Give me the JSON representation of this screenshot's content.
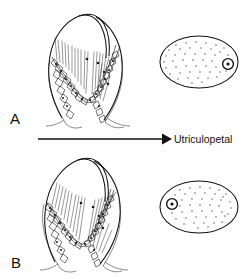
{
  "figure": {
    "background_color": "#ffffff",
    "ink_color": "#1a1a1a",
    "width": 249,
    "height": 279
  },
  "panels": [
    {
      "id": "A",
      "letter": "A",
      "letter_x": 10,
      "letter_y": 124,
      "crista_label": "crista-ampullaris-resting",
      "cross_section": {
        "label": "ampulla-cross-section-a",
        "cx": 199,
        "cy": 62,
        "rx": 39,
        "ry": 26,
        "marker": {
          "label": "cupula-marker",
          "cx": 228,
          "cy": 64,
          "r_outer": 5.4,
          "r_inner": 1.6,
          "position": "right"
        }
      }
    },
    {
      "id": "B",
      "letter": "B",
      "letter_x": 11,
      "letter_y": 268,
      "crista_label": "crista-ampullaris-deflected",
      "cross_section": {
        "label": "ampulla-cross-section-b",
        "cx": 199,
        "cy": 207,
        "rx": 39,
        "ry": 26,
        "marker": {
          "label": "cupula-marker",
          "cx": 172,
          "cy": 204,
          "r_outer": 5.4,
          "r_inner": 1.6,
          "position": "left"
        }
      }
    }
  ],
  "arrow": {
    "label": "direction-arrow",
    "x1": 38,
    "y1": 139,
    "x2": 170,
    "y2": 139,
    "caption": "Utriculopetal",
    "caption_x": 174,
    "caption_y": 143
  },
  "accessibility": {
    "description": "Line drawing of a crista ampullaris shown in two states, A above and B below, each paired with an oval cross-section containing scattered stipple dots and a small circled dot marker. A horizontal arrow between the two rows is labeled Utriculopetal."
  }
}
